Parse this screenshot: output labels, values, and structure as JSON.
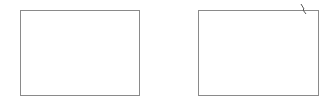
{
  "panels": [
    {
      "id": "left",
      "border_color": "#8a8a8a",
      "fill": "#ffffff"
    },
    {
      "id": "right",
      "border_color": "#8a8a8a",
      "fill": "#ffffff"
    }
  ],
  "marks": [
    {
      "shape": "short diagonal stroke",
      "near": "top-right corner of right panel",
      "color": "#555555"
    }
  ]
}
